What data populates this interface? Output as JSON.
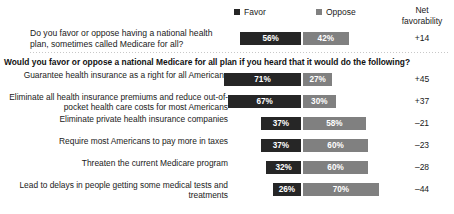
{
  "legend": {
    "favor_label": "Favor",
    "oppose_label": "Oppose",
    "favor_color": "#262626",
    "oppose_color": "#808080"
  },
  "net_column": {
    "header_line1": "Net",
    "header_line2": "favorability"
  },
  "top_question": {
    "text": "Do you favor or oppose having a national health plan, sometimes called Medicare for all?",
    "favor": "56%",
    "oppose": "42%",
    "net": "+14"
  },
  "section_header": "Would you favor or oppose a national Medicare for all plan if you heard that it would do the following?",
  "chart_data": {
    "type": "bar",
    "title": "",
    "subtitle": "",
    "xlabel": "",
    "ylabel": "",
    "orientation": "horizontal",
    "style": "diverging-stacked",
    "legend_position": "top",
    "grid": false,
    "unit": "percent",
    "series": [
      {
        "name": "Favor",
        "color": "#262626",
        "values": [
          56,
          71,
          67,
          37,
          37,
          32,
          26
        ]
      },
      {
        "name": "Oppose",
        "color": "#808080",
        "values": [
          42,
          27,
          30,
          58,
          60,
          60,
          70
        ]
      }
    ],
    "net_favorability": [
      14,
      45,
      37,
      -21,
      -23,
      -28,
      -44
    ],
    "categories": [
      "Do you favor or oppose having a national health plan, sometimes called Medicare for all?",
      "Guarantee health insurance as a right for all Americans",
      "Eliminate all health insurance premiums and reduce out-of-pocket health care costs for most Americans",
      "Eliminate private health insurance companies",
      "Require most Americans to pay more in taxes",
      "Threaten the current Medicare program",
      "Lead to delays in people getting some medical tests and treatments"
    ]
  },
  "rows": [
    {
      "label": "Guarantee health insurance as a right for all Americans",
      "favor": "71%",
      "oppose": "27%",
      "net": "+45",
      "favor_value": 71,
      "oppose_value": 27
    },
    {
      "label": "Eliminate all health insurance premiums and reduce out-of-pocket health care costs for most Americans",
      "favor": "67%",
      "oppose": "30%",
      "net": "+37",
      "favor_value": 67,
      "oppose_value": 30
    },
    {
      "label": "Eliminate private health insurance companies",
      "favor": "37%",
      "oppose": "58%",
      "net": "–21",
      "favor_value": 37,
      "oppose_value": 58
    },
    {
      "label": "Require most Americans to pay more in taxes",
      "favor": "37%",
      "oppose": "60%",
      "net": "–23",
      "favor_value": 37,
      "oppose_value": 60
    },
    {
      "label": "Threaten the current Medicare program",
      "favor": "32%",
      "oppose": "60%",
      "net": "–28",
      "favor_value": 32,
      "oppose_value": 60
    },
    {
      "label": "Lead to delays in people getting some medical tests and treatments",
      "favor": "26%",
      "oppose": "70%",
      "net": "–44",
      "favor_value": 26,
      "oppose_value": 70
    }
  ]
}
